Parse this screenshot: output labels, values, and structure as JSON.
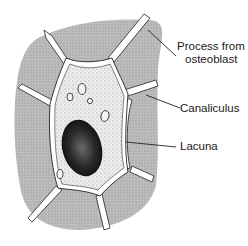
{
  "diagram": {
    "labels": [
      {
        "id": "process",
        "line1": "Process from",
        "line2": "osteoblast"
      },
      {
        "id": "canaliculus",
        "line1": "Canaliculus"
      },
      {
        "id": "lacuna",
        "line1": "Lacuna"
      }
    ]
  },
  "colors": {
    "matrix": "#b8b8b8",
    "cell": "#e6e6e6",
    "nucleus": "#1e1e1e",
    "outline": "#222222",
    "channel": "#ffffff"
  }
}
